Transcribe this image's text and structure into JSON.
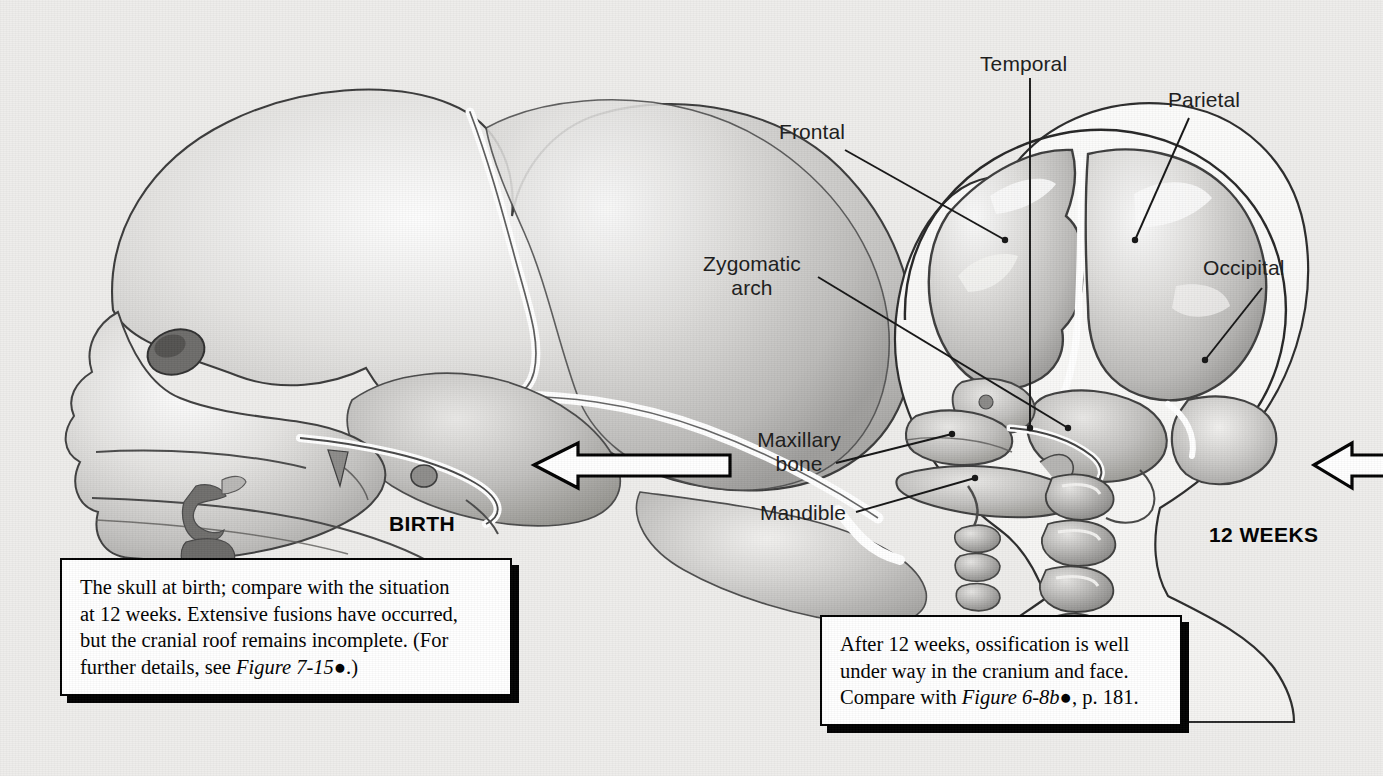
{
  "figure": {
    "background_color": "#eeedeb",
    "ink_color": "#1b1b1b"
  },
  "panels": {
    "left": {
      "stage_label": "BIRTH",
      "subject": "newborn-skull-lateral-view",
      "caption": {
        "line1": "The skull at birth; compare with the situation",
        "line2": "at 12 weeks. Extensive fusions have occurred,",
        "line3": "but the cranial roof remains incomplete. (For",
        "line4_pre": "further details, see ",
        "line4_italic": "Figure 7-15",
        "line4_dot": "●",
        "line4_post": ".)"
      }
    },
    "right": {
      "stage_label": "12 WEEKS",
      "subject": "twelve-week-fetal-head-lateral-view",
      "caption": {
        "line1": "After 12 weeks, ossification is well",
        "line2": "under way in the cranium and face.",
        "line3_pre": "Compare with ",
        "line3_italic": "Figure 6-8b",
        "line3_dot": "●",
        "line3_post": ", p. 181."
      },
      "labels": [
        {
          "id": "frontal",
          "text": "Frontal",
          "align": "left"
        },
        {
          "id": "temporal",
          "text": "Temporal",
          "align": "left"
        },
        {
          "id": "parietal",
          "text": "Parietal",
          "align": "left"
        },
        {
          "id": "occipital",
          "text": "Occipital",
          "align": "left"
        },
        {
          "id": "zygomatic-arch",
          "text": "Zygomatic\narch",
          "align": "right"
        },
        {
          "id": "maxillary-bone",
          "text": "Maxillary\nbone",
          "align": "right"
        },
        {
          "id": "mandible",
          "text": "Mandible",
          "align": "right"
        }
      ]
    }
  },
  "arrows": [
    {
      "id": "arrow-middle",
      "direction": "left",
      "style": "white-fill-black-outline"
    },
    {
      "id": "arrow-right-edge",
      "direction": "left",
      "style": "white-fill-black-outline"
    }
  ]
}
